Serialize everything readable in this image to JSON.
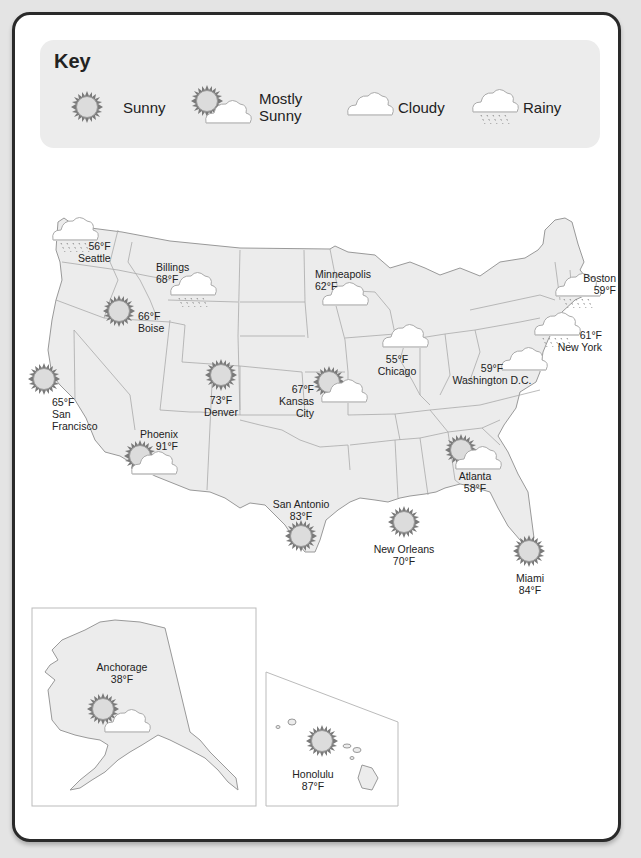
{
  "key": {
    "title": "Key",
    "items": [
      {
        "icon": "sunny",
        "label": "Sunny"
      },
      {
        "icon": "mostly-sunny",
        "label_line1": "Mostly",
        "label_line2": "Sunny"
      },
      {
        "icon": "cloudy",
        "label": "Cloudy"
      },
      {
        "icon": "rainy",
        "label": "Rainy"
      }
    ]
  },
  "colors": {
    "frame": "#2a2a2a",
    "key_bg": "#ececec",
    "land": "#ececec",
    "border": "#999999",
    "sun_rays": "#7a7a7a",
    "sun_fill": "#dcdcdc"
  },
  "cities": [
    {
      "name": "Seattle",
      "temp": "56°F",
      "weather": "rainy"
    },
    {
      "name": "Billings",
      "temp": "68°F",
      "weather": "rainy"
    },
    {
      "name": "Boise",
      "temp": "66°F",
      "weather": "sunny"
    },
    {
      "name": "San Francisco",
      "name_line1": "San",
      "name_line2": "Francisco",
      "temp": "65°F",
      "weather": "sunny"
    },
    {
      "name": "Denver",
      "temp": "73°F",
      "weather": "sunny"
    },
    {
      "name": "Kansas City",
      "name_line1": "Kansas",
      "name_line2": "City",
      "temp": "67°F",
      "weather": "mostly-sunny"
    },
    {
      "name": "Phoenix",
      "temp": "91°F",
      "weather": "mostly-sunny"
    },
    {
      "name": "Minneapolis",
      "temp": "62°F",
      "weather": "cloudy"
    },
    {
      "name": "Chicago",
      "temp": "55°F",
      "weather": "cloudy"
    },
    {
      "name": "Washington D.C.",
      "temp": "59°F",
      "weather": "cloudy"
    },
    {
      "name": "Boston",
      "temp": "59°F",
      "weather": "rainy"
    },
    {
      "name": "New York",
      "temp": "61°F",
      "weather": "rainy"
    },
    {
      "name": "San Antonio",
      "temp": "83°F",
      "weather": "sunny"
    },
    {
      "name": "New Orleans",
      "temp": "70°F",
      "weather": "sunny"
    },
    {
      "name": "Atlanta",
      "temp": "58°F",
      "weather": "mostly-sunny"
    },
    {
      "name": "Miami",
      "temp": "84°F",
      "weather": "sunny"
    },
    {
      "name": "Anchorage",
      "temp": "38°F",
      "weather": "mostly-sunny"
    },
    {
      "name": "Honolulu",
      "temp": "87°F",
      "weather": "sunny"
    }
  ]
}
